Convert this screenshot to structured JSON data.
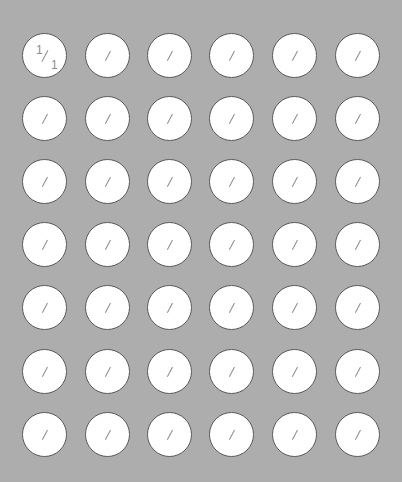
{
  "board": {
    "rows": 7,
    "cols": 6,
    "colors": {
      "background": "#adadad",
      "cell_fill": "#ffffff",
      "cell_border": "#5a5a5a",
      "glyph": "#8c8c8c"
    },
    "cells": [
      [
        {
          "top": "1",
          "bottom": "1"
        },
        {
          "top": "",
          "bottom": ""
        },
        {
          "top": "",
          "bottom": ""
        },
        {
          "top": "",
          "bottom": ""
        },
        {
          "top": "",
          "bottom": ""
        },
        {
          "top": "",
          "bottom": ""
        }
      ],
      [
        {
          "top": "",
          "bottom": ""
        },
        {
          "top": "",
          "bottom": ""
        },
        {
          "top": "",
          "bottom": ""
        },
        {
          "top": "",
          "bottom": ""
        },
        {
          "top": "",
          "bottom": ""
        },
        {
          "top": "",
          "bottom": ""
        }
      ],
      [
        {
          "top": "",
          "bottom": ""
        },
        {
          "top": "",
          "bottom": ""
        },
        {
          "top": "",
          "bottom": ""
        },
        {
          "top": "",
          "bottom": ""
        },
        {
          "top": "",
          "bottom": ""
        },
        {
          "top": "",
          "bottom": ""
        }
      ],
      [
        {
          "top": "",
          "bottom": ""
        },
        {
          "top": "",
          "bottom": ""
        },
        {
          "top": "",
          "bottom": ""
        },
        {
          "top": "",
          "bottom": ""
        },
        {
          "top": "",
          "bottom": ""
        },
        {
          "top": "",
          "bottom": ""
        }
      ],
      [
        {
          "top": "",
          "bottom": ""
        },
        {
          "top": "",
          "bottom": ""
        },
        {
          "top": "",
          "bottom": ""
        },
        {
          "top": "",
          "bottom": ""
        },
        {
          "top": "",
          "bottom": ""
        },
        {
          "top": "",
          "bottom": ""
        }
      ],
      [
        {
          "top": "",
          "bottom": ""
        },
        {
          "top": "",
          "bottom": ""
        },
        {
          "top": "",
          "bottom": ""
        },
        {
          "top": "",
          "bottom": ""
        },
        {
          "top": "",
          "bottom": ""
        },
        {
          "top": "",
          "bottom": ""
        }
      ],
      [
        {
          "top": "",
          "bottom": ""
        },
        {
          "top": "",
          "bottom": ""
        },
        {
          "top": "",
          "bottom": ""
        },
        {
          "top": "",
          "bottom": ""
        },
        {
          "top": "",
          "bottom": ""
        },
        {
          "top": "",
          "bottom": ""
        }
      ]
    ]
  }
}
